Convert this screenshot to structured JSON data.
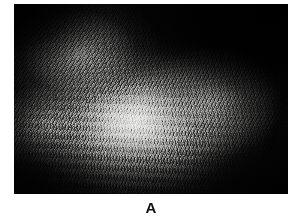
{
  "figure": {
    "panel_label": "A",
    "caption_alignment": "center",
    "background_color": "#ffffff",
    "image": {
      "alt_description": "Grayscale photomicrograph of scalp skin showing dense, short hair shafts radiating across a brightly illuminated dome against a black background",
      "modality": "photograph",
      "color_mode": "grayscale",
      "border_color": "#000000",
      "darkest_tone": "#000000",
      "brightest_tone": "#f2f2f0",
      "dominant_feature": "radiating hair shafts",
      "highlight_center_x_pct": 44,
      "highlight_center_y_pct": 62,
      "frame": {
        "left_px": 14,
        "top_px": 4,
        "width_px": 274,
        "height_px": 190
      }
    }
  }
}
